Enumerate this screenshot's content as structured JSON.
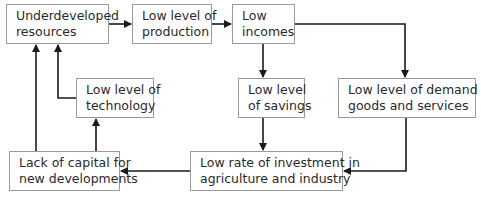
{
  "diagram": {
    "type": "flowchart",
    "colors": {
      "line": "#1a1a1a",
      "border": "#9a9a9a",
      "text": "#2a2a2a",
      "background": "#ffffff"
    },
    "nodes": [
      {
        "id": "underdeveloped",
        "line1": "Underdeveloped",
        "line2": "resources"
      },
      {
        "id": "production",
        "line1": "Low level of",
        "line2": "production"
      },
      {
        "id": "incomes",
        "line1": "Low",
        "line2": "incomes"
      },
      {
        "id": "technology",
        "line1": "Low level of",
        "line2": "technology"
      },
      {
        "id": "savings",
        "line1": "Low level",
        "line2": "of savings"
      },
      {
        "id": "demand",
        "line1": "Low level of demand for",
        "line2": "goods and services"
      },
      {
        "id": "capital",
        "line1": "Lack of capital for",
        "line2": "new developments"
      },
      {
        "id": "investment",
        "line1": "Low rate of investment in",
        "line2": "agriculture and industry"
      }
    ],
    "edges": [
      {
        "from": "underdeveloped",
        "to": "production"
      },
      {
        "from": "production",
        "to": "incomes"
      },
      {
        "from": "incomes",
        "to": "savings"
      },
      {
        "from": "incomes",
        "to": "demand"
      },
      {
        "from": "savings",
        "to": "investment"
      },
      {
        "from": "demand",
        "to": "investment"
      },
      {
        "from": "investment",
        "to": "capital"
      },
      {
        "from": "capital",
        "to": "technology"
      },
      {
        "from": "capital",
        "to": "underdeveloped"
      },
      {
        "from": "technology",
        "to": "underdeveloped"
      }
    ]
  }
}
